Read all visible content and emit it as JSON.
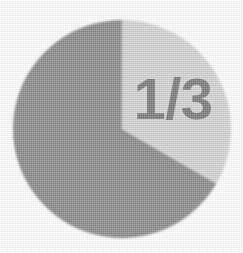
{
  "figure": {
    "name": "one-third-pie-chart",
    "background_color": "#ffffff",
    "width": 243,
    "height": 253
  },
  "chart_data": {
    "type": "pie",
    "title": "",
    "subtitle": "",
    "xlabel": "",
    "ylabel": "",
    "grid": false,
    "legend_position": "none",
    "center": {
      "x": 122,
      "y": 129
    },
    "radius": 109,
    "start_angle_deg": 0,
    "direction": "clockwise",
    "categories": [
      "highlighted third",
      "remaining two thirds"
    ],
    "values": [
      33.3333,
      66.6667
    ],
    "fractions": [
      "1/3",
      "2/3"
    ],
    "colors": [
      "#d3d3d3",
      "#8a8a8a"
    ],
    "slices": [
      {
        "name": "highlighted third",
        "fraction": "1/3",
        "value": 33.3333,
        "start_angle_deg": 0,
        "end_angle_deg": 120,
        "color": "#d3d3d3",
        "label": "1/3",
        "label_color": "#7a7a7a",
        "label_visible": true
      },
      {
        "name": "remaining two thirds",
        "fraction": "2/3",
        "value": 66.6667,
        "start_angle_deg": 120,
        "end_angle_deg": 360,
        "color": "#8a8a8a",
        "label": "",
        "label_color": "#7a7a7a",
        "label_visible": false
      }
    ],
    "annotations": [
      {
        "text": "1/3",
        "x": 172,
        "y": 100,
        "color": "#7a7a7a",
        "font_size": 52
      }
    ]
  },
  "label": {
    "numerator": "1",
    "separator": "/",
    "denominator": "3",
    "text": "1/3",
    "color": "#7a7a7a"
  },
  "palette": {
    "light_slice": "#d3d3d3",
    "dark_slice": "#8a8a8a",
    "label_gray": "#7a7a7a",
    "background": "#ffffff",
    "edge_soft": "#bdbdbd"
  }
}
